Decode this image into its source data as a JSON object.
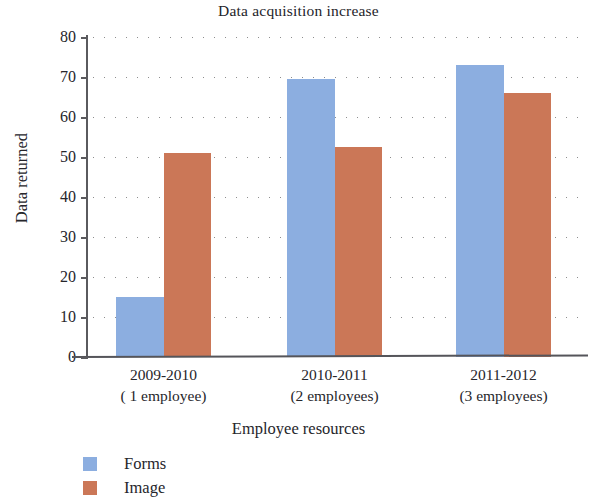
{
  "chart_data": {
    "type": "bar",
    "title": "Data acquisition increase",
    "xlabel": "Employee resources",
    "ylabel": "Data returned",
    "categories": [
      "2009-2010",
      "2010-2011",
      "2011-2012"
    ],
    "category_sublabels": [
      "( 1 employee)",
      "(2 employees)",
      "(3 employees)"
    ],
    "series": [
      {
        "name": "Forms",
        "color": "#8CAEE0",
        "values": [
          15,
          69.5,
          73
        ]
      },
      {
        "name": "Image",
        "color": "#CB7757",
        "values": [
          51,
          52.5,
          66
        ]
      }
    ],
    "ylim": [
      0,
      80
    ],
    "ytick_labels": [
      "80",
      "70",
      "60",
      "50",
      "40",
      "30",
      "20",
      "10",
      "0"
    ],
    "ytick_values": [
      80,
      70,
      60,
      50,
      40,
      30,
      20,
      10,
      0
    ],
    "grid": "horizontal-dotted",
    "legend_position": "bottom-left"
  }
}
